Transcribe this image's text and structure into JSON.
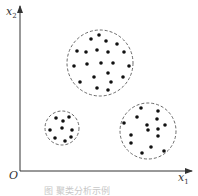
{
  "figure": {
    "axes": {
      "origin_label": "O",
      "x_label": "x",
      "x_sub": "1",
      "y_label": "x",
      "y_sub": "2",
      "origin": [
        20,
        171
      ],
      "x_end": 192,
      "y_end": 6
    },
    "caption": "图        聚类分析示例",
    "style": {
      "point_color": "#111111",
      "circle_color": "#444444",
      "axis_color": "#333333"
    },
    "clusters": [
      {
        "name": "cluster-large",
        "center": [
          100,
          63
        ],
        "radius": 33,
        "points": [
          [
            99,
            35
          ],
          [
            91,
            39
          ],
          [
            106,
            41
          ],
          [
            117,
            44
          ],
          [
            77,
            51
          ],
          [
            86,
            52
          ],
          [
            97,
            50
          ],
          [
            108,
            52
          ],
          [
            124,
            52
          ],
          [
            74,
            66
          ],
          [
            87,
            64
          ],
          [
            101,
            63
          ],
          [
            113,
            63
          ],
          [
            129,
            66
          ],
          [
            108,
            73
          ],
          [
            94,
            77
          ],
          [
            123,
            77
          ],
          [
            80,
            82
          ],
          [
            111,
            82
          ],
          [
            97,
            88
          ],
          [
            108,
            90
          ]
        ]
      },
      {
        "name": "cluster-small",
        "center": [
          62,
          128
        ],
        "radius": 17,
        "points": [
          [
            56,
            118
          ],
          [
            63,
            121
          ],
          [
            69,
            117
          ],
          [
            50,
            130
          ],
          [
            62,
            128
          ],
          [
            72,
            130
          ],
          [
            55,
            138
          ],
          [
            65,
            141
          ],
          [
            71,
            137
          ]
        ]
      },
      {
        "name": "cluster-right",
        "center": [
          148,
          131
        ],
        "radius": 28,
        "points": [
          [
            141,
            108
          ],
          [
            158,
            111
          ],
          [
            137,
            117
          ],
          [
            157,
            119
          ],
          [
            124,
            123
          ],
          [
            147,
            125
          ],
          [
            165,
            125
          ],
          [
            148,
            130
          ],
          [
            158,
            129
          ],
          [
            131,
            135
          ],
          [
            158,
            136
          ],
          [
            131,
            143
          ],
          [
            151,
            147
          ],
          [
            142,
            153
          ],
          [
            164,
            151
          ]
        ]
      }
    ]
  }
}
